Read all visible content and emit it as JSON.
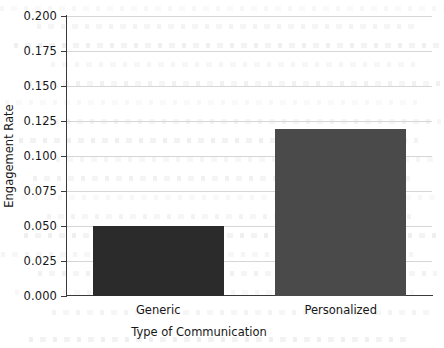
{
  "chart_data": {
    "type": "bar",
    "title": "",
    "xlabel": "Type of Communication",
    "ylabel": "Engagement Rate",
    "categories": [
      "Generic",
      "Personalized"
    ],
    "values": [
      0.05,
      0.119
    ],
    "series": [
      {
        "name": "Engagement Rate",
        "values": [
          0.05,
          0.119
        ]
      }
    ],
    "bars": [
      {
        "category": "Generic",
        "value": 0.05,
        "color": "#2b2b2b"
      },
      {
        "category": "Personalized",
        "value": 0.119,
        "color": "#4a4a4a"
      }
    ],
    "ylim": [
      0.0,
      0.2
    ],
    "ytick_values": [
      0.0,
      0.025,
      0.05,
      0.075,
      0.1,
      0.125,
      0.15,
      0.175,
      0.2
    ],
    "ytick_labels": [
      "0.000",
      "0.025",
      "0.050",
      "0.075",
      "0.100",
      "0.125",
      "0.150",
      "0.175",
      "0.200"
    ],
    "grid": true,
    "grid_axis": "y",
    "grid_color": "#d6d6d8",
    "legend": null,
    "legend_position": "none",
    "annotations": [],
    "spines": [
      "left",
      "bottom"
    ],
    "background_color": "#ffffff",
    "axis_color": "#3a3a3a"
  }
}
